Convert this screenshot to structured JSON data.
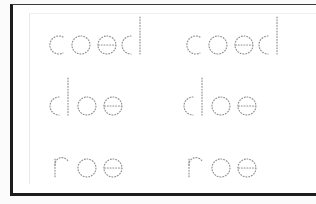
{
  "document": {
    "type": "handwriting-tracing-worksheet",
    "title": "",
    "page_background": "#ffffff",
    "frame_color": "#1c1c1c",
    "trace_stroke_color": "#8f8f96",
    "columns": 2,
    "rows": [
      {
        "word": "coed",
        "left_copy": "coed",
        "right_copy": "coed",
        "indent": 28
      },
      {
        "word": "doe",
        "left_copy": "doe",
        "right_copy": "doe",
        "indent": 34
      },
      {
        "word": "roe",
        "left_copy": "roe",
        "right_copy": "roe",
        "indent": 34
      }
    ],
    "letters": {
      "c": "letter-c",
      "o": "letter-o",
      "e": "letter-e",
      "d": "letter-d",
      "r": "letter-r"
    }
  }
}
